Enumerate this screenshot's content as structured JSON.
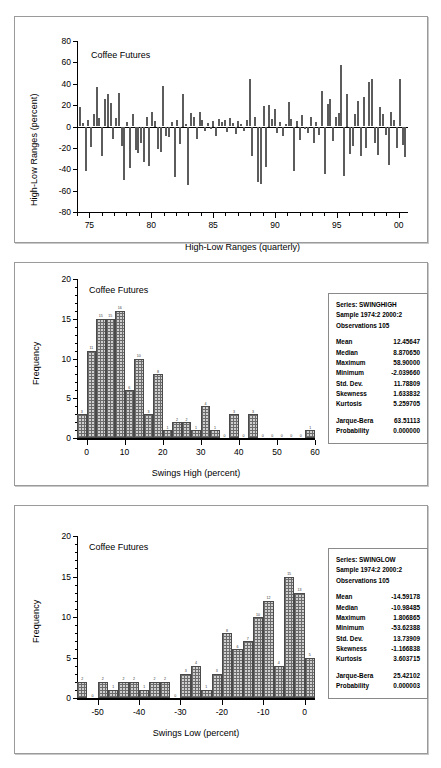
{
  "figure": {
    "panels": [
      "top-series-panel",
      "mid-histogram-panel",
      "bottom-histogram-panel"
    ]
  },
  "chart_data": [
    {
      "type": "bar",
      "id": "high-low-ranges",
      "title": "Coffee Futures",
      "xlabel": "High-Low Ranges (quarterly)",
      "ylabel": "High-Low Ranges (percent)",
      "ylim": [
        -80,
        80
      ],
      "yticks": [
        "80",
        "60",
        "40",
        "20",
        "0",
        "-20",
        "-40",
        "-60",
        "-80"
      ],
      "xlim": [
        1974.0,
        2000.75
      ],
      "xticks": [
        "75",
        "80",
        "85",
        "90",
        "95",
        "00"
      ],
      "xtick_values": [
        1975,
        1980,
        1985,
        1990,
        1995,
        2000
      ],
      "grid": false,
      "legend": "none",
      "values": [
        18,
        3,
        -42,
        6,
        -19,
        12,
        37,
        8,
        -28,
        26,
        30,
        22,
        -12,
        8,
        31,
        -18,
        -50,
        4,
        -39,
        12,
        -22,
        -25,
        -15,
        -33,
        9,
        -37,
        14,
        5,
        -21,
        -24,
        38,
        -9,
        -10,
        4,
        -47,
        6,
        -16,
        30,
        2,
        -55,
        13,
        9,
        -12,
        14,
        6,
        -4,
        3,
        -2,
        5,
        -9,
        7,
        4,
        6,
        -5,
        8,
        3,
        -7,
        5,
        2,
        -4,
        6,
        44,
        -28,
        9,
        -52,
        -54,
        19,
        -38,
        20,
        7,
        16,
        -6,
        4,
        -9,
        2,
        23,
        7,
        -42,
        5,
        -13,
        11,
        -2,
        -6,
        9,
        -15,
        4,
        -8,
        33,
        -44,
        21,
        26,
        -14,
        9,
        13,
        58,
        -46,
        30,
        -26,
        -18,
        12,
        24,
        -28,
        28,
        -20,
        42,
        44,
        -15,
        -27,
        18,
        12,
        -8,
        -36,
        14,
        6,
        -20,
        44,
        -17,
        -29
      ],
      "note": "quarterly high-low range, percent"
    },
    {
      "type": "bar",
      "id": "swings-high-histogram",
      "title": "Coffee Futures",
      "xlabel": "Swings High (percent)",
      "ylabel": "Frequency",
      "ylim": [
        0,
        20
      ],
      "yticks": [
        "20",
        "15",
        "10",
        "5",
        "0"
      ],
      "xlim": [
        -2.5,
        60
      ],
      "xticks": [
        "0",
        "10",
        "20",
        "30",
        "40",
        "50",
        "60"
      ],
      "xtick_values": [
        0,
        10,
        20,
        30,
        40,
        50,
        60
      ],
      "bin_width": 2.5,
      "bin_starts": [
        -2.5,
        0,
        2.5,
        5,
        7.5,
        10,
        12.5,
        15,
        17.5,
        20,
        22.5,
        25,
        27.5,
        30,
        32.5,
        35,
        37.5,
        40,
        42.5,
        45,
        47.5,
        50,
        52.5,
        55,
        57.5
      ],
      "values": [
        3,
        11,
        15,
        15,
        16,
        6,
        10,
        3,
        8,
        1,
        2,
        2,
        1,
        4,
        1,
        0,
        3,
        0,
        3,
        0,
        0,
        0,
        0,
        0,
        1
      ],
      "grid": false,
      "legend": "none",
      "stats": {
        "series": "Series: SWINGHIGH",
        "sample": "Sample 1974:2 2000:2",
        "observations": "Observations 105",
        "rows": [
          {
            "k": "Mean",
            "v": "12.45647"
          },
          {
            "k": "Median",
            "v": "8.870650"
          },
          {
            "k": "Maximum",
            "v": "58.90000"
          },
          {
            "k": "Minimum",
            "v": "-2.039660"
          },
          {
            "k": "Std. Dev.",
            "v": "11.78809"
          },
          {
            "k": "Skewness",
            "v": "1.633832"
          },
          {
            "k": "Kurtosis",
            "v": "5.259705"
          }
        ],
        "tests": [
          {
            "k": "Jarque-Bera",
            "v": "63.51113"
          },
          {
            "k": "Probability",
            "v": "0.000000"
          }
        ]
      }
    },
    {
      "type": "bar",
      "id": "swings-low-histogram",
      "title": "Coffee Futures",
      "xlabel": "Swings Low (percent)",
      "ylabel": "Frequency",
      "ylim": [
        0,
        20
      ],
      "yticks": [
        "20",
        "15",
        "10",
        "5",
        "0"
      ],
      "xlim": [
        -55,
        2.5
      ],
      "xticks": [
        "-50",
        "-40",
        "-30",
        "-20",
        "-10",
        "0"
      ],
      "xtick_values": [
        -50,
        -40,
        -30,
        -20,
        -10,
        0
      ],
      "bin_width": 2.5,
      "bin_starts": [
        -55,
        -52.5,
        -50,
        -47.5,
        -45,
        -42.5,
        -40,
        -37.5,
        -35,
        -32.5,
        -30,
        -27.5,
        -25,
        -22.5,
        -20,
        -17.5,
        -15,
        -12.5,
        -10,
        -7.5,
        -5,
        -2.5,
        0
      ],
      "values": [
        2,
        0,
        2,
        1,
        2,
        2,
        1,
        2,
        2,
        0,
        3,
        4,
        1,
        3,
        8,
        6,
        7,
        10,
        12,
        4,
        15,
        13,
        5
      ],
      "grid": false,
      "legend": "none",
      "stats": {
        "series": "Series: SWINGLOW",
        "sample": "Sample 1974:2 2000:2",
        "observations": "Observations 105",
        "rows": [
          {
            "k": "Mean",
            "v": "-14.59178"
          },
          {
            "k": "Median",
            "v": "-10.98485"
          },
          {
            "k": "Maximum",
            "v": "1.806865"
          },
          {
            "k": "Minimum",
            "v": "-53.62388"
          },
          {
            "k": "Std. Dev.",
            "v": "13.73909"
          },
          {
            "k": "Skewness",
            "v": "-1.166838"
          },
          {
            "k": "Kurtosis",
            "v": "3.603715"
          }
        ],
        "tests": [
          {
            "k": "Jarque-Bera",
            "v": "25.42102"
          },
          {
            "k": "Probability",
            "v": "0.000003"
          }
        ]
      }
    }
  ]
}
